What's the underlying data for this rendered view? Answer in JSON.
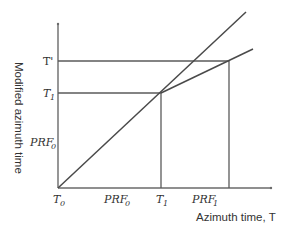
{
  "diagram": {
    "y_axis_title": "Modified azimuth time",
    "x_axis_title": "Azimuth time, T",
    "y_labels": {
      "t_prime": "T'",
      "t1_base": "T",
      "t1_sub": "1",
      "prf0_base": "PRF",
      "prf0_sub": "0"
    },
    "x_labels": {
      "t0_base": "T",
      "t0_sub": "0",
      "prf0_base": "PRF",
      "prf0_sub": "0",
      "t1_base": "T",
      "t1_sub": "1",
      "prf1_base": "PRF",
      "prf1_sub": "1"
    },
    "lines": [
      {
        "name": "identity-line",
        "from": "T0",
        "through": "(T1, T1)",
        "extends": "beyond"
      },
      {
        "name": "modified-line",
        "from": "(T1, T1)",
        "through": "(PRF1, T')",
        "slope": "reduced"
      }
    ],
    "colors": {
      "axis": "#6a6a6a",
      "line": "#4a4a4a",
      "text": "#333333"
    }
  }
}
